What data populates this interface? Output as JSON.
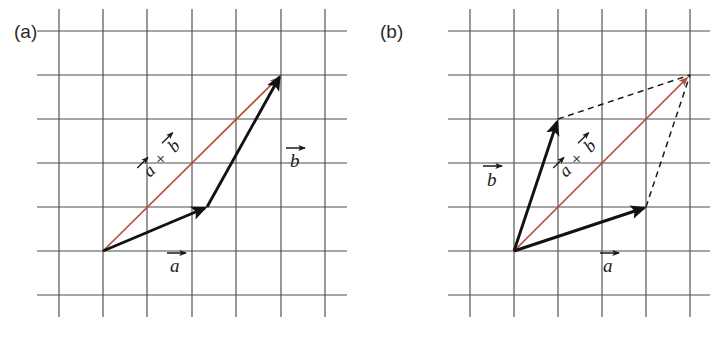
{
  "figure": {
    "width": 710,
    "height": 344,
    "background": "#ffffff",
    "colors": {
      "grid": "#4d4d4d",
      "vector_black": "#121212",
      "vector_red": "#b5503c",
      "dashed": "#1a1a1a",
      "text": "#2b2b2b"
    }
  },
  "panels": [
    {
      "id": "a",
      "label": "(a)",
      "label_x": 14,
      "label_y": 38,
      "grid": {
        "x_lines": [
          59,
          103,
          147,
          192,
          236,
          281,
          325
        ],
        "y_lines": [
          31,
          75,
          119,
          163,
          207,
          251,
          295
        ],
        "x_min": 37,
        "x_max": 347,
        "y_min": 9,
        "y_max": 317,
        "spacing": 44
      },
      "origin": {
        "x": 103,
        "y": 251
      },
      "vectors": [
        {
          "name": "vector-a",
          "label": "a",
          "color": "black",
          "from": {
            "x": 103,
            "y": 251
          },
          "to": {
            "x": 207,
            "y": 207
          },
          "label_x": 175,
          "label_y": 268
        },
        {
          "name": "vector-b",
          "label": "b",
          "color": "black",
          "from": {
            "x": 207,
            "y": 207
          },
          "to": {
            "x": 281,
            "y": 75
          },
          "label_x": 280,
          "label_y": 163
        },
        {
          "name": "vector-sum",
          "label": "a + b",
          "color": "red",
          "from": {
            "x": 103,
            "y": 251
          },
          "to": {
            "x": 281,
            "y": 75
          },
          "label_x": 160,
          "label_y": 165,
          "label_rotation": -45
        }
      ],
      "dashed_lines": []
    },
    {
      "id": "b",
      "label": "(b)",
      "label_x": 380,
      "label_y": 38,
      "grid": {
        "x_lines": [
          470,
          514,
          558,
          602,
          646,
          690
        ],
        "y_lines": [
          31,
          75,
          119,
          163,
          207,
          251,
          295
        ],
        "x_min": 448,
        "x_max": 710,
        "y_min": 9,
        "y_max": 317,
        "spacing": 44
      },
      "origin": {
        "x": 514,
        "y": 251
      },
      "vectors": [
        {
          "name": "vector-a",
          "label": "a",
          "color": "black",
          "from": {
            "x": 514,
            "y": 251
          },
          "to": {
            "x": 646,
            "y": 207
          },
          "label_x": 610,
          "label_y": 268
        },
        {
          "name": "vector-b",
          "label": "b",
          "color": "black",
          "from": {
            "x": 514,
            "y": 251
          },
          "to": {
            "x": 558,
            "y": 119
          },
          "label_x": 490,
          "label_y": 175
        },
        {
          "name": "vector-sum",
          "label": "a + b",
          "color": "red",
          "from": {
            "x": 514,
            "y": 251
          },
          "to": {
            "x": 690,
            "y": 75
          },
          "label_x": 578,
          "label_y": 165,
          "label_rotation": -45
        }
      ],
      "dashed_lines": [
        {
          "name": "dashed-parallel-a",
          "from": {
            "x": 558,
            "y": 119
          },
          "to": {
            "x": 690,
            "y": 75
          }
        },
        {
          "name": "dashed-parallel-b",
          "from": {
            "x": 646,
            "y": 207
          },
          "to": {
            "x": 690,
            "y": 75
          }
        }
      ]
    }
  ],
  "labels": {
    "vec_a": "a",
    "vec_b": "b",
    "plus": "+",
    "panel_a": "(a)",
    "panel_b": "(b)"
  }
}
